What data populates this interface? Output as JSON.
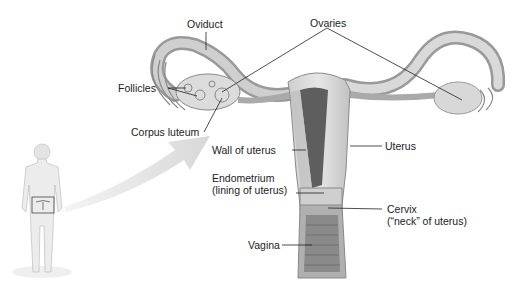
{
  "diagram": {
    "labels": {
      "oviduct": "Oviduct",
      "ovaries": "Ovaries",
      "follicles": "Follicles",
      "corpus_luteum": "Corpus luteum",
      "wall_of_uterus": "Wall of uterus",
      "uterus": "Uterus",
      "endometrium_line1": "Endometrium",
      "endometrium_line2": "(lining of uterus)",
      "cervix_line1": "Cervix",
      "cervix_line2": "(“neck” of uterus)",
      "vagina": "Vagina"
    },
    "colors": {
      "tissue_light": "#d9d9d9",
      "tissue_mid": "#b8b8b8",
      "tissue_dark": "#6e6e6e",
      "leader_line": "#222222",
      "arrow": "#e2e2e2"
    }
  }
}
